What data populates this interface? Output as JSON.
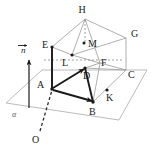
{
  "figure": {
    "background_color": "#ffffff",
    "stroke_thin_color": "#9a9a9a",
    "stroke_bold_color": "#1a1a1a",
    "dash_color": "#7a7a7a",
    "canvas": {
      "width": 153,
      "height": 149
    },
    "plane": {
      "name": "alpha",
      "label": "α",
      "label_pos": {
        "x": 14,
        "y": 117
      },
      "outline": "6,103 42,70 147,70 119,120"
    },
    "vector": {
      "label": "n",
      "label_pos": {
        "x": 20,
        "y": 50
      },
      "has_overbar": true,
      "tail": {
        "x": 29,
        "y": 108
      },
      "tip": {
        "x": 29,
        "y": 58
      }
    },
    "points": [
      {
        "id": "H",
        "label": "H",
        "label_x": 86,
        "label_y": 12,
        "x": 85,
        "y": 19,
        "dot": false
      },
      {
        "id": "G",
        "label": "G",
        "label_x": 131,
        "label_y": 36,
        "x": 126,
        "y": 38,
        "dot": false
      },
      {
        "id": "M",
        "label": "M",
        "label_x": 89,
        "label_y": 45,
        "x": 84,
        "y": 43,
        "dot": true
      },
      {
        "id": "E",
        "label": "E",
        "label_x": 43,
        "label_y": 46,
        "x": 52,
        "y": 47,
        "dot": true
      },
      {
        "id": "L",
        "label": "L",
        "label_x": 64,
        "label_y": 64,
        "x": 72,
        "y": 55,
        "dot": true
      },
      {
        "id": "F",
        "label": "F",
        "label_x": 104,
        "label_y": 65,
        "x": 100,
        "y": 63,
        "dot": false
      },
      {
        "id": "C",
        "label": "C",
        "label_x": 129,
        "label_y": 76,
        "x": 126,
        "y": 70,
        "dot": false
      },
      {
        "id": "D",
        "label": "D",
        "label_x": 86,
        "label_y": 77,
        "x": 85,
        "y": 68,
        "dot": true
      },
      {
        "id": "A",
        "label": "A",
        "label_x": 39,
        "label_y": 86,
        "x": 52,
        "y": 89,
        "dot": true
      },
      {
        "id": "K",
        "label": "K",
        "label_x": 110,
        "label_y": 99,
        "x": 107,
        "y": 90,
        "dot": true
      },
      {
        "id": "B",
        "label": "B",
        "label_x": 93,
        "label_y": 114,
        "x": 93,
        "y": 102,
        "dot": true
      },
      {
        "id": "O",
        "label": "O",
        "label_x": 34,
        "label_y": 142,
        "x": 39,
        "y": 133,
        "dot": false
      }
    ],
    "thin_edges": [
      {
        "from": "E",
        "to": "H",
        "d": "M52,47 L85,19"
      },
      {
        "from": "H",
        "to": "G",
        "d": "M85,19 L126,38"
      },
      {
        "from": "E",
        "to": "L",
        "d": "M52,47 L72,55"
      },
      {
        "from": "L",
        "to": "G",
        "d": "M72,55 L126,38"
      },
      {
        "from": "H",
        "to": "L",
        "d": "M85,19 L72,55"
      },
      {
        "from": "H",
        "to": "F",
        "d": "M85,19 L100,63"
      },
      {
        "from": "G",
        "to": "C",
        "d": "M126,38 L126,70"
      },
      {
        "from": "L",
        "to": "F",
        "d": "M72,55 L100,63"
      },
      {
        "from": "F",
        "to": "C",
        "d": "M100,63 L126,70"
      },
      {
        "from": "D",
        "to": "F",
        "d": "M85,68 L100,63"
      },
      {
        "from": "D",
        "to": "C",
        "d": "M85,68 L126,70"
      },
      {
        "from": "E",
        "to": "A",
        "d": "M52,47 L52,89"
      },
      {
        "from": "B",
        "to": "C",
        "d": "M93,102 L126,70"
      },
      {
        "from": "B",
        "to": "F",
        "d": "M93,102 L100,63"
      }
    ],
    "bold_edges": [
      {
        "from": "A",
        "to": "D",
        "d": "M52,89 L85,68"
      },
      {
        "from": "A",
        "to": "B",
        "d": "M52,89 L93,102"
      },
      {
        "from": "D",
        "to": "B",
        "d": "M85,68 L93,102"
      },
      {
        "from": "A",
        "to": "E",
        "d": "M52,89 L52,47"
      }
    ],
    "dashed_edges": [
      {
        "from": "O",
        "to": "A",
        "d": "M39,133 L52,89"
      },
      {
        "from": "L",
        "to": "F",
        "d": "M44,60 L120,60"
      },
      {
        "from": "H",
        "to": "M",
        "d": "M85,19 L85,43"
      }
    ],
    "arrows": [
      {
        "name": "normal-vector-arrow",
        "from": "vector.tail",
        "to": "vector.tip"
      },
      {
        "name": "ad-arrow",
        "from": "A",
        "to": "D"
      },
      {
        "name": "ab-arrow",
        "from": "A",
        "to": "B"
      }
    ]
  }
}
